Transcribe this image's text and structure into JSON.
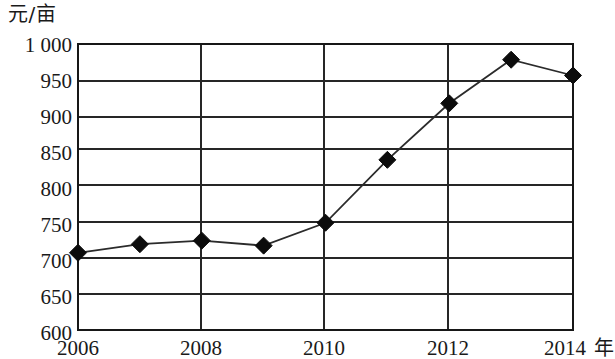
{
  "chart_data": {
    "type": "line",
    "title": "",
    "subtitle": "",
    "xlabel": "年",
    "ylabel": "元/亩",
    "x": [
      2006,
      2007,
      2008,
      2009,
      2010,
      2011,
      2012,
      2013,
      2014
    ],
    "values": [
      708,
      720,
      725,
      718,
      750,
      838,
      917,
      978,
      956
    ],
    "series": [
      {
        "name": "元/亩",
        "values": [
          708,
          720,
          725,
          718,
          750,
          838,
          917,
          978,
          956
        ]
      }
    ],
    "x_tick_labels": [
      "2006",
      "2008",
      "2010",
      "2012",
      "2014"
    ],
    "x_tick_values": [
      2006,
      2008,
      2010,
      2012,
      2014
    ],
    "y_tick_labels": [
      "600",
      "650",
      "700",
      "750",
      "800",
      "850",
      "900",
      "950",
      "1 000"
    ],
    "y_tick_values": [
      600,
      650,
      700,
      750,
      800,
      850,
      900,
      950,
      1000
    ],
    "xlim": [
      2006,
      2014
    ],
    "ylim": [
      600,
      1000
    ],
    "grid": "horizontal-and-vertical",
    "legend": "none",
    "marker": "diamond",
    "line_color": "#2b2b2b",
    "marker_color": "#0c0c0c",
    "grid_color": "#262626",
    "background": "#ffffff"
  },
  "axes": {
    "y_unit_label": "元/亩",
    "x_unit_label": "年",
    "y_ticks": [
      {
        "label": "1 000",
        "value": 1000
      },
      {
        "label": "950",
        "value": 950
      },
      {
        "label": "900",
        "value": 900
      },
      {
        "label": "850",
        "value": 850
      },
      {
        "label": "800",
        "value": 800
      },
      {
        "label": "750",
        "value": 750
      },
      {
        "label": "700",
        "value": 700
      },
      {
        "label": "650",
        "value": 650
      },
      {
        "label": "600",
        "value": 600
      }
    ],
    "x_ticks": [
      {
        "label": "2006",
        "value": 2006
      },
      {
        "label": "2008",
        "value": 2008
      },
      {
        "label": "2010",
        "value": 2010
      },
      {
        "label": "2012",
        "value": 2012
      },
      {
        "label": "2014",
        "value": 2014
      }
    ]
  }
}
